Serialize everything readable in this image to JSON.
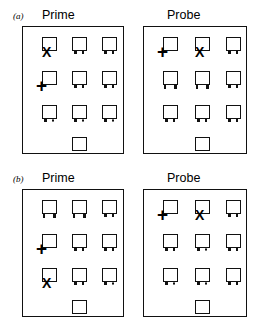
{
  "figure": {
    "type": "stimulus-array-diagram",
    "background": "#ffffff",
    "ink": "#111111",
    "panels": [
      {
        "letter": "(a)",
        "columns": [
          {
            "title": "Prime",
            "rows": [
              [
                {
                  "icon": "lamp-icon",
                  "feet": [
                    "none",
                    "none"
                  ],
                  "marker": "X"
                },
                {
                  "icon": "lamp-icon",
                  "feet": [
                    "solid",
                    "solid"
                  ],
                  "marker": ""
                },
                {
                  "icon": "lamp-icon",
                  "feet": [
                    "solid",
                    "solid"
                  ],
                  "marker": ""
                }
              ],
              [
                {
                  "icon": "lamp-icon",
                  "feet": [
                    "none",
                    "none"
                  ],
                  "marker": "+"
                },
                {
                  "icon": "lamp-icon",
                  "feet": [
                    "solid",
                    "solid"
                  ],
                  "marker": ""
                },
                {
                  "icon": "lamp-icon",
                  "feet": [
                    "solid",
                    "solid"
                  ],
                  "marker": ""
                }
              ],
              [
                {
                  "icon": "lamp-icon",
                  "feet": [
                    "solid",
                    "hollow"
                  ],
                  "marker": ""
                },
                {
                  "icon": "lamp-icon",
                  "feet": [
                    "solid",
                    "hollow"
                  ],
                  "marker": ""
                },
                {
                  "icon": "lamp-icon",
                  "feet": [
                    "solid",
                    "hollow"
                  ],
                  "marker": ""
                }
              ]
            ],
            "lone_square": {
              "icon": "plain-square-icon"
            }
          },
          {
            "title": "Probe",
            "rows": [
              [
                {
                  "icon": "lamp-icon",
                  "feet": [
                    "none",
                    "none"
                  ],
                  "marker": "+"
                },
                {
                  "icon": "lamp-icon",
                  "feet": [
                    "none",
                    "none"
                  ],
                  "marker": "X"
                },
                {
                  "icon": "lamp-icon",
                  "feet": [
                    "solid",
                    "solid"
                  ],
                  "marker": ""
                }
              ],
              [
                {
                  "icon": "lamp-icon",
                  "feet": [
                    "tall",
                    "tall"
                  ],
                  "marker": ""
                },
                {
                  "icon": "lamp-icon",
                  "feet": [
                    "tall",
                    "tall"
                  ],
                  "marker": ""
                },
                {
                  "icon": "lamp-icon",
                  "feet": [
                    "solid",
                    "solid"
                  ],
                  "marker": ""
                }
              ],
              [
                {
                  "icon": "lamp-icon",
                  "feet": [
                    "solid",
                    "solid"
                  ],
                  "marker": ""
                },
                {
                  "icon": "lamp-icon",
                  "feet": [
                    "solid",
                    "solid"
                  ],
                  "marker": ""
                },
                {
                  "icon": "lamp-icon",
                  "feet": [
                    "solid",
                    "solid"
                  ],
                  "marker": ""
                }
              ]
            ],
            "lone_square": {
              "icon": "plain-square-icon"
            }
          }
        ]
      },
      {
        "letter": "(b)",
        "columns": [
          {
            "title": "Prime",
            "rows": [
              [
                {
                  "icon": "lamp-icon",
                  "feet": [
                    "tall",
                    "tall"
                  ],
                  "marker": ""
                },
                {
                  "icon": "lamp-icon",
                  "feet": [
                    "tall",
                    "tall"
                  ],
                  "marker": ""
                },
                {
                  "icon": "lamp-icon",
                  "feet": [
                    "solid",
                    "solid"
                  ],
                  "marker": ""
                }
              ],
              [
                {
                  "icon": "lamp-icon",
                  "feet": [
                    "none",
                    "none"
                  ],
                  "marker": "+"
                },
                {
                  "icon": "lamp-icon",
                  "feet": [
                    "solid",
                    "solid"
                  ],
                  "marker": ""
                },
                {
                  "icon": "lamp-icon",
                  "feet": [
                    "solid",
                    "solid"
                  ],
                  "marker": ""
                }
              ],
              [
                {
                  "icon": "lamp-icon",
                  "feet": [
                    "none",
                    "none"
                  ],
                  "marker": "X"
                },
                {
                  "icon": "lamp-icon",
                  "feet": [
                    "solid",
                    "solid"
                  ],
                  "marker": ""
                },
                {
                  "icon": "lamp-icon",
                  "feet": [
                    "solid",
                    "hollow"
                  ],
                  "marker": ""
                }
              ]
            ],
            "lone_square": {
              "icon": "plain-square-icon"
            }
          },
          {
            "title": "Probe",
            "rows": [
              [
                {
                  "icon": "lamp-icon",
                  "feet": [
                    "none",
                    "none"
                  ],
                  "marker": "+"
                },
                {
                  "icon": "lamp-icon",
                  "feet": [
                    "none",
                    "none"
                  ],
                  "marker": "X"
                },
                {
                  "icon": "lamp-icon",
                  "feet": [
                    "solid",
                    "solid"
                  ],
                  "marker": ""
                }
              ],
              [
                {
                  "icon": "lamp-icon",
                  "feet": [
                    "solid",
                    "solid"
                  ],
                  "marker": ""
                },
                {
                  "icon": "lamp-icon",
                  "feet": [
                    "solid",
                    "hollow"
                  ],
                  "marker": ""
                },
                {
                  "icon": "lamp-icon",
                  "feet": [
                    "solid",
                    "solid"
                  ],
                  "marker": ""
                }
              ],
              [
                {
                  "icon": "lamp-icon",
                  "feet": [
                    "solid",
                    "hollow"
                  ],
                  "marker": ""
                },
                {
                  "icon": "lamp-icon",
                  "feet": [
                    "solid",
                    "hollow"
                  ],
                  "marker": ""
                },
                {
                  "icon": "lamp-icon",
                  "feet": [
                    "solid",
                    "solid"
                  ],
                  "marker": ""
                }
              ]
            ],
            "lone_square": {
              "icon": "plain-square-icon"
            }
          }
        ]
      }
    ]
  }
}
